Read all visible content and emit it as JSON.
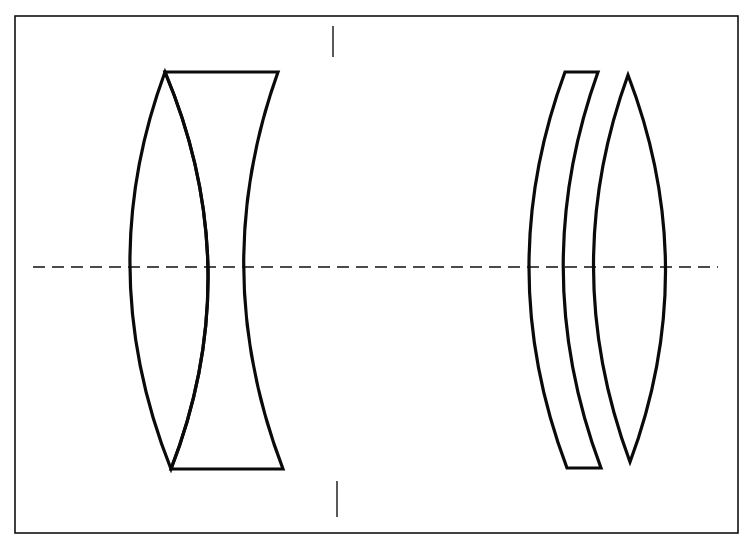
{
  "diagram": {
    "type": "optical-lens-layout",
    "colors": {
      "background": "#ffffff",
      "line": "#0a0a0a"
    },
    "frame": {
      "x1": 15,
      "y1": 16,
      "x2": 738,
      "y2": 533
    },
    "optical_axis": {
      "y": 267,
      "x1": 33,
      "x2": 718,
      "style": "dashed"
    },
    "aperture_stop": {
      "top": {
        "x": 333,
        "y1": 26,
        "y2": 57
      },
      "bottom": {
        "x": 337,
        "y1": 481,
        "y2": 517
      }
    },
    "elements": [
      {
        "name": "front-biconvex-element",
        "path": "M 165 72 Q 92 270 171 469 Q 248 270 165 72 Z"
      },
      {
        "name": "front-biconcave-element",
        "path": "M 165 72 L 278 72 Q 207 270 283 469 L 171 469 Q 248 270 165 72 Z"
      },
      {
        "name": "rear-meniscus-element",
        "path": "M 565 72 L 598 72 Q 527 270 601 468 L 567 468 Q 492 270 565 72 Z"
      },
      {
        "name": "rear-biconvex-element",
        "path": "M 628 75 Q 558 268 630 462 Q 702 268 628 75 Z"
      }
    ]
  }
}
